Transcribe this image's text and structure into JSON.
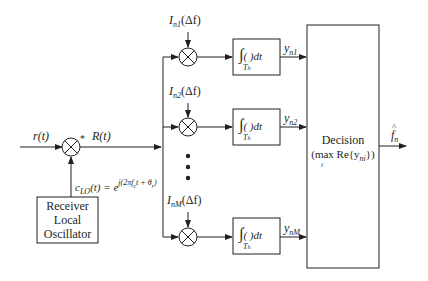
{
  "diagram": {
    "input_signal": "r(t)",
    "conjugate_mark": "*",
    "mixed_signal": "R(t)",
    "lo_signal": {
      "name": "c",
      "name_sub": "LO",
      "arg": "(t) = e",
      "exponent": "j(2πf",
      "exponent_sub": "c",
      "exponent_mid": "t + θ",
      "exponent_sub2": "r",
      "exponent_end": ")"
    },
    "lo_block": {
      "line1": "Receiver",
      "line2": "Local",
      "line3": "Oscillator"
    },
    "branches": [
      {
        "ref_name": "I",
        "ref_sub": "n1",
        "ref_arg": "(Δf)",
        "out_name": "y",
        "out_sub": "n1"
      },
      {
        "ref_name": "I",
        "ref_sub": "n2",
        "ref_arg": "(Δf)",
        "out_name": "y",
        "out_sub": "n2"
      },
      {
        "ref_name": "I",
        "ref_sub": "nM",
        "ref_arg": "(Δf)",
        "out_name": "y",
        "out_sub": "nM"
      }
    ],
    "integrator": {
      "symbol": "∫",
      "limit": "T",
      "limit_sub": "h",
      "body": "(   )dt"
    },
    "decision_block": {
      "title": "Decision",
      "expr_pre": "(max Re{y",
      "expr_sub": "ni",
      "expr_post": "})",
      "max_index": "i"
    },
    "output_signal": {
      "name": "f",
      "hat": "^",
      "sub": "n"
    },
    "ellipsis": "⋮"
  }
}
